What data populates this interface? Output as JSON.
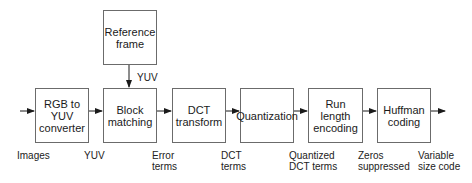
{
  "diagram": {
    "colors": {
      "stroke": "#6b6b6b",
      "arrow": "#1a1a1a",
      "text": "#1a1a1a"
    },
    "boxes": [
      {
        "id": "rgb-to-yuv",
        "label": "RGB to\nYUV\nconverter"
      },
      {
        "id": "reference-frame",
        "label": "Reference\nframe"
      },
      {
        "id": "block-matching",
        "label": "Block\nmatching"
      },
      {
        "id": "dct-transform",
        "label": "DCT\ntransform"
      },
      {
        "id": "quantization",
        "label": "Quantization"
      },
      {
        "id": "run-length-encoding",
        "label": "Run\nlength\nencoding"
      },
      {
        "id": "huffman-coding",
        "label": "Huffman\ncoding"
      }
    ],
    "edge_labels": {
      "reference_to_block": "YUV"
    },
    "bottom_labels": [
      "Images",
      "YUV",
      "Error\nterms",
      "DCT\nterms",
      "Quantized\nDCT terms",
      "Zeros\nsuppressed",
      "Variable\nsize code"
    ]
  }
}
